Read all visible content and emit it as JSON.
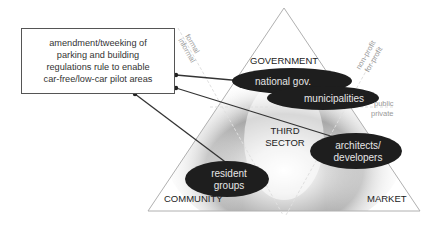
{
  "callout": {
    "lines": [
      "amendment/tweeking of",
      "parking and building",
      "regulations rule to enable",
      "car-free/low-car pilot areas"
    ]
  },
  "triangle": {
    "corners": {
      "top": "GOVERNMENT",
      "bottom_left": "COMMUNITY",
      "bottom_right": "MARKET",
      "center": [
        "THIRD",
        "SECTOR"
      ]
    },
    "axis_labels": {
      "formal": "formal",
      "informal": "informal",
      "non_profit": "non-profit",
      "for_profit": "for-profit",
      "public": "public",
      "private": "private"
    }
  },
  "actors": [
    {
      "id": "national-gov",
      "lines": [
        "national gov."
      ]
    },
    {
      "id": "municipalities",
      "lines": [
        "municipalities"
      ]
    },
    {
      "id": "architects-developers",
      "lines": [
        "architects/",
        "developers"
      ]
    },
    {
      "id": "resident-groups",
      "lines": [
        "resident",
        "groups"
      ]
    }
  ],
  "colors": {
    "ellipse_fill": "#1e1e1e",
    "ellipse_text": "#e6e6e6",
    "triangle_stroke": "#b0b0b0",
    "connector": "#333333",
    "label_gray": "#999999"
  }
}
